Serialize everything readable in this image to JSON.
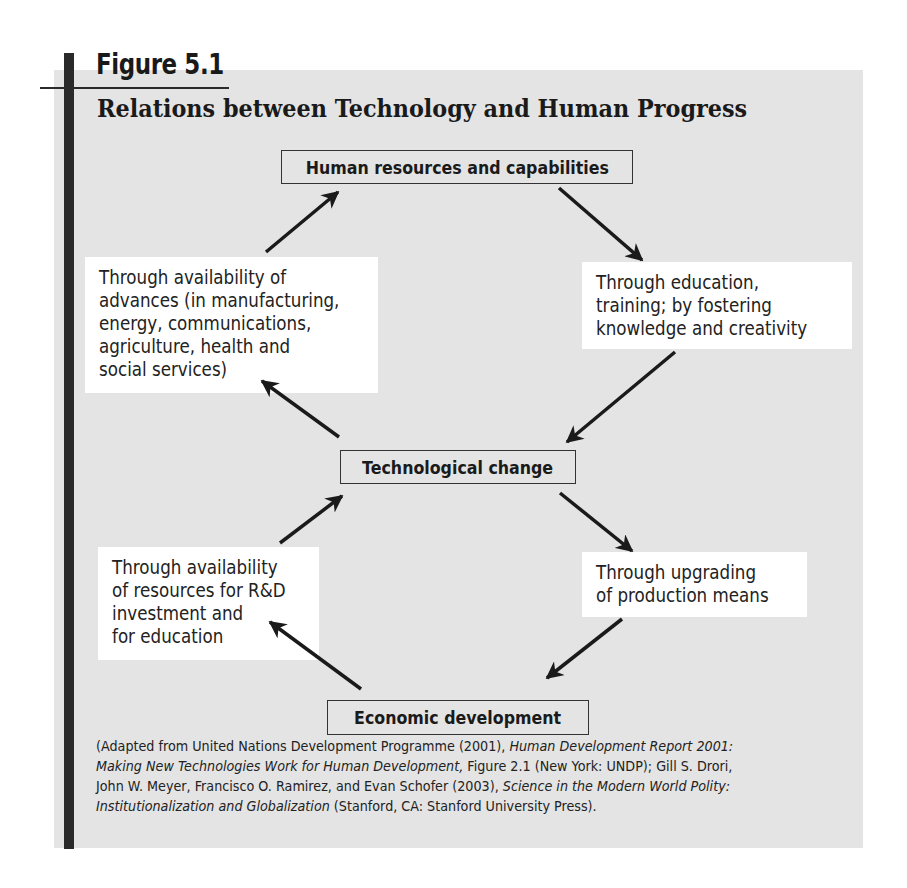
{
  "figure": {
    "label": "Figure 5.1",
    "title": "Relations between Technology and Human Progress"
  },
  "nodes": {
    "human": "Human resources and capabilities",
    "tech": "Technological change",
    "econ": "Economic development"
  },
  "notes": {
    "upper_left": [
      "Through availability of",
      "advances (in manufacturing,",
      "energy, communications,",
      "agriculture, health and",
      "social services)"
    ],
    "upper_right": [
      "Through education,",
      "training; by fostering",
      "knowledge and creativity"
    ],
    "lower_left": [
      "Through availability",
      "of resources for R&D",
      "investment and",
      "for education"
    ],
    "lower_right": [
      "Through upgrading",
      "of production means"
    ]
  },
  "arrows": [
    {
      "from": "upper_left_note",
      "to": "human",
      "x1": 266,
      "y1": 252,
      "x2": 338,
      "y2": 192
    },
    {
      "from": "human",
      "to": "upper_right_note",
      "x1": 559,
      "y1": 188,
      "x2": 642,
      "y2": 260
    },
    {
      "from": "upper_right_note",
      "to": "tech",
      "x1": 675,
      "y1": 352,
      "x2": 567,
      "y2": 442
    },
    {
      "from": "tech",
      "to": "upper_left_note",
      "x1": 339,
      "y1": 437,
      "x2": 262,
      "y2": 381
    },
    {
      "from": "lower_left_note",
      "to": "tech",
      "x1": 280,
      "y1": 543,
      "x2": 342,
      "y2": 496
    },
    {
      "from": "tech",
      "to": "lower_right_note",
      "x1": 560,
      "y1": 493,
      "x2": 632,
      "y2": 551
    },
    {
      "from": "lower_right_note",
      "to": "econ",
      "x1": 622,
      "y1": 619,
      "x2": 547,
      "y2": 678
    },
    {
      "from": "econ",
      "to": "lower_left_note",
      "x1": 361,
      "y1": 689,
      "x2": 270,
      "y2": 622
    }
  ],
  "source": {
    "line1_a": "(Adapted from United Nations Development Programme (2001), ",
    "line1_b": "Human Development Report 2001:",
    "line2_a": "Making New Technologies Work for Human Development,",
    "line2_b": " Figure 2.1 (New York: UNDP); Gill S. Drori,",
    "line3_a": "John W. Meyer, Francisco O. Ramirez, and Evan Schofer (2003), ",
    "line3_b": "Science in the Modern World Polity:",
    "line4_a": "Institutionalization and Globalization",
    "line4_b": " (Stanford, CA: Stanford University Press)."
  },
  "colors": {
    "panel": "#e4e4e4",
    "ink": "#1a1a1a",
    "note_bg": "#ffffff"
  }
}
